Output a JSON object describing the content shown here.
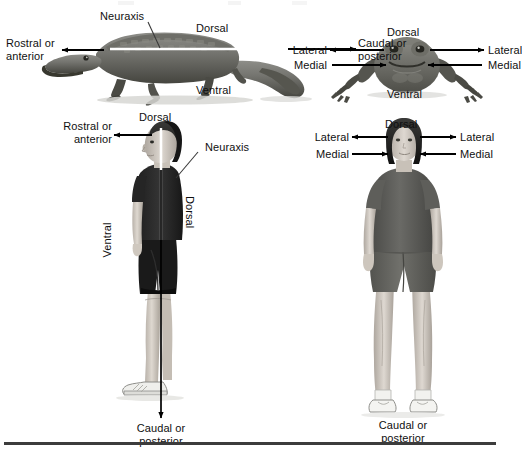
{
  "figure": {
    "title_ghost": "Neuraxis",
    "background_color": "#ffffff",
    "rule_color": "#3c3c3c",
    "arrow_color": "#000000",
    "leader_color": "#3a3a3a",
    "neuraxis_line_color": "#ffffff"
  },
  "panels": {
    "crocodile": {
      "name": "crocodile-lateral-view",
      "labels": {
        "neuraxis": "Neuraxis",
        "dorsal": "Dorsal",
        "ventral": "Ventral",
        "rostral": "Rostral or\nanterior",
        "caudal": "Caudal or\nposterior"
      }
    },
    "frog": {
      "name": "frog-dorsal-view",
      "labels": {
        "dorsal": "Dorsal",
        "ventral": "Ventral",
        "lateral_left": "Lateral",
        "lateral_right": "Lateral",
        "medial_left": "Medial",
        "medial_right": "Medial"
      }
    },
    "human_male": {
      "name": "human-male-lateral-view",
      "labels": {
        "dorsal_top": "Dorsal",
        "rostral": "Rostral or\nanterior",
        "neuraxis": "Neuraxis",
        "ventral_side": "Ventral",
        "dorsal_side": "Dorsal",
        "caudal": "Caudal or\nposterior"
      }
    },
    "human_female": {
      "name": "human-female-frontal-view",
      "labels": {
        "dorsal": "Dorsal",
        "lateral_left": "Lateral",
        "lateral_right": "Lateral",
        "medial_left": "Medial",
        "medial_right": "Medial",
        "caudal": "Caudal or\nposterior"
      }
    }
  }
}
